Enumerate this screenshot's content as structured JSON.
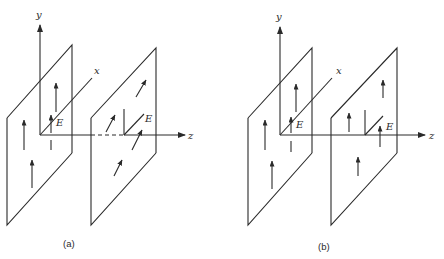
{
  "figure": {
    "panels": [
      {
        "caption": "(a)",
        "axes": {
          "y": "y",
          "x": "x",
          "z": "z"
        },
        "field_label_1": "E",
        "field_label_2": "E",
        "description": "Two parallel planes; field E vertical (y) in first plane, rotated/tilted in second plane; dashed z-axis segment between planes"
      },
      {
        "caption": "(b)",
        "axes": {
          "y": "y",
          "x": "x",
          "z": "z"
        },
        "field_label_1": "E",
        "field_label_2": "E",
        "description": "Two parallel planes; field E vertical (y) in both planes; solid z-axis"
      }
    ],
    "colors": {
      "line": "#2a2a2a",
      "background": "#ffffff"
    }
  }
}
